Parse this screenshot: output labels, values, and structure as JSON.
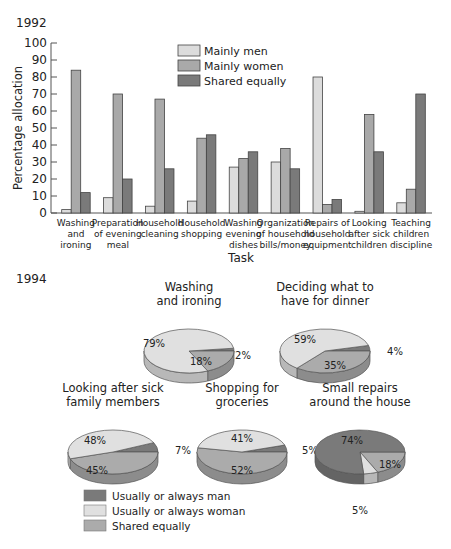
{
  "chart_data": [
    {
      "type": "bar",
      "title": "1992",
      "xlabel": "Task",
      "ylabel": "Percentage allocation",
      "ylim": [
        0,
        100
      ],
      "yticks": [
        0,
        10,
        20,
        30,
        40,
        50,
        60,
        70,
        80,
        90,
        100
      ],
      "grid": false,
      "legend_position": "top-right",
      "categories": [
        [
          "Washing",
          "and",
          "ironing"
        ],
        [
          "Preparation",
          "of evening",
          "meal"
        ],
        [
          "Household",
          "cleaning"
        ],
        [
          "Household",
          "shopping"
        ],
        [
          "Washing",
          "evening",
          "dishes"
        ],
        [
          "Organization",
          "of household",
          "bills/money"
        ],
        [
          "Repairs of",
          "household",
          "equipment"
        ],
        [
          "Looking",
          "after sick",
          "children"
        ],
        [
          "Teaching",
          "children",
          "discipline"
        ]
      ],
      "series": [
        {
          "name": "Mainly men",
          "color": "#dcdcdc",
          "values": [
            2,
            9,
            4,
            7,
            27,
            30,
            80,
            1,
            6
          ]
        },
        {
          "name": "Mainly women",
          "color": "#a9a9a9",
          "values": [
            84,
            70,
            67,
            44,
            32,
            38,
            5,
            58,
            14
          ]
        },
        {
          "name": "Shared equally",
          "color": "#7a7a7a",
          "values": [
            12,
            20,
            26,
            46,
            36,
            26,
            8,
            36,
            70
          ]
        }
      ]
    },
    {
      "type": "pie",
      "title": "1994",
      "legend": [
        {
          "name": "Usually or always man",
          "color": "#7a7a7a"
        },
        {
          "name": "Usually or always woman",
          "color": "#e0e0e0"
        },
        {
          "name": "Shared equally",
          "color": "#ababab"
        }
      ],
      "pies": [
        {
          "title": [
            "Washing",
            "and ironing"
          ],
          "slices": [
            {
              "name": "Usually or always woman",
              "value": 79
            },
            {
              "name": "Shared equally",
              "value": 18
            },
            {
              "name": "Usually or always man",
              "value": 2
            }
          ]
        },
        {
          "title": [
            "Deciding what to",
            "have for dinner"
          ],
          "slices": [
            {
              "name": "Usually or always woman",
              "value": 59
            },
            {
              "name": "Shared equally",
              "value": 35
            },
            {
              "name": "Usually or always man",
              "value": 4
            }
          ]
        },
        {
          "title": [
            "Looking after sick",
            "family members"
          ],
          "slices": [
            {
              "name": "Usually or always woman",
              "value": 48
            },
            {
              "name": "Shared equally",
              "value": 45
            },
            {
              "name": "Usually or always man",
              "value": 7
            }
          ]
        },
        {
          "title": [
            "Shopping for",
            "groceries"
          ],
          "slices": [
            {
              "name": "Usually or always woman",
              "value": 41
            },
            {
              "name": "Shared equally",
              "value": 52
            },
            {
              "name": "Usually or always man",
              "value": 5
            }
          ]
        },
        {
          "title": [
            "Small repairs",
            "around the house"
          ],
          "slices": [
            {
              "name": "Usually or always man",
              "value": 74
            },
            {
              "name": "Shared equally",
              "value": 18
            },
            {
              "name": "Usually or always woman",
              "value": 5
            }
          ]
        }
      ]
    }
  ],
  "labels": {
    "year1992": "1992",
    "year1994": "1994"
  }
}
